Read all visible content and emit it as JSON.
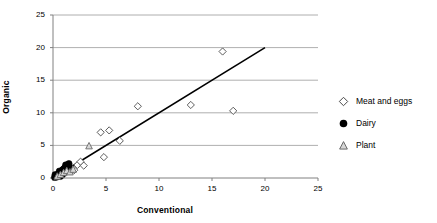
{
  "chart_data": {
    "type": "scatter",
    "title": "",
    "xlabel": "Conventional",
    "ylabel": "Organic",
    "xlim": [
      0,
      25
    ],
    "ylim": [
      0,
      25
    ],
    "xticks": [
      0,
      5,
      10,
      15,
      20,
      25
    ],
    "yticks": [
      0,
      5,
      10,
      15,
      20,
      25
    ],
    "grid": "horizontal",
    "legend_position": "right",
    "series": [
      {
        "name": "Meat and eggs",
        "marker": "open-diamond",
        "color": "#000000",
        "points": [
          [
            1.5,
            1.9
          ],
          [
            1.7,
            1.5
          ],
          [
            2.0,
            1.2
          ],
          [
            2.3,
            2.0
          ],
          [
            2.6,
            2.5
          ],
          [
            2.9,
            1.9
          ],
          [
            4.5,
            7.0
          ],
          [
            4.8,
            3.2
          ],
          [
            5.3,
            7.3
          ],
          [
            6.3,
            5.7
          ],
          [
            8.0,
            11.0
          ],
          [
            13.0,
            11.2
          ],
          [
            16.0,
            19.4
          ],
          [
            17.0,
            10.3
          ]
        ]
      },
      {
        "name": "Dairy",
        "marker": "filled-circle",
        "color": "#000000",
        "points": [
          [
            0.15,
            0.1
          ],
          [
            0.25,
            0.2
          ],
          [
            0.3,
            0.35
          ],
          [
            0.4,
            0.3
          ],
          [
            0.45,
            0.55
          ],
          [
            0.5,
            0.45
          ],
          [
            0.55,
            0.7
          ],
          [
            0.6,
            0.6
          ],
          [
            0.65,
            0.85
          ],
          [
            0.7,
            0.75
          ],
          [
            0.75,
            1.0
          ],
          [
            0.8,
            0.9
          ],
          [
            0.85,
            1.15
          ],
          [
            0.9,
            1.05
          ],
          [
            0.95,
            1.3
          ],
          [
            1.0,
            1.2
          ],
          [
            1.05,
            1.45
          ],
          [
            1.1,
            1.35
          ],
          [
            1.15,
            1.6
          ],
          [
            1.2,
            1.5
          ],
          [
            1.25,
            1.75
          ],
          [
            1.3,
            1.65
          ],
          [
            1.35,
            1.9
          ],
          [
            1.4,
            1.8
          ],
          [
            1.45,
            2.05
          ],
          [
            1.5,
            1.95
          ],
          [
            0.2,
            0.5
          ],
          [
            0.35,
            0.15
          ],
          [
            0.6,
            1.05
          ],
          [
            0.9,
            0.55
          ],
          [
            1.15,
            0.95
          ],
          [
            1.35,
            1.25
          ],
          [
            1.45,
            1.55
          ],
          [
            1.5,
            2.2
          ],
          [
            1.2,
            2.0
          ],
          [
            0.7,
            0.25
          ]
        ]
      },
      {
        "name": "Plant",
        "marker": "open-triangle",
        "color": "#808080",
        "points": [
          [
            0.4,
            0.25
          ],
          [
            0.7,
            0.5
          ],
          [
            1.0,
            0.8
          ],
          [
            1.3,
            1.1
          ],
          [
            1.6,
            0.9
          ],
          [
            1.9,
            1.3
          ],
          [
            3.4,
            4.9
          ]
        ]
      }
    ],
    "trendline": {
      "from": [
        0,
        0
      ],
      "to": [
        20,
        20
      ]
    }
  },
  "legend": {
    "entries": [
      {
        "label": "Meat and eggs"
      },
      {
        "label": "Dairy"
      },
      {
        "label": "Plant"
      }
    ]
  }
}
